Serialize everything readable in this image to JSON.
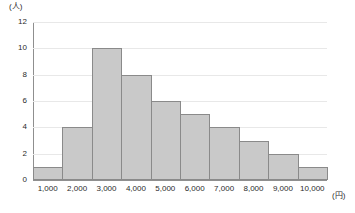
{
  "chart_data": {
    "type": "bar",
    "title": "",
    "subtitle": "",
    "xlabel": "(円)",
    "ylabel": "(人)",
    "xlim": [
      1000,
      10000
    ],
    "ylim": [
      0,
      12
    ],
    "grid": true,
    "legend": "none",
    "bin_edges": [
      1000,
      2000,
      3000,
      4000,
      5000,
      6000,
      7000,
      8000,
      9000,
      10000,
      11000
    ],
    "categories": [
      "1,000-2,000",
      "2,000-3,000",
      "3,000-4,000",
      "4,000-5,000",
      "5,000-6,000",
      "6,000-7,000",
      "7,000-8,000",
      "8,000-9,000",
      "9,000-10,000",
      "10,000-11,000"
    ],
    "values": [
      1,
      4,
      10,
      8,
      6,
      5,
      4,
      3,
      2,
      1
    ],
    "x_tick_labels": [
      "1,000",
      "2,000",
      "3,000",
      "4,000",
      "5,000",
      "6,000",
      "7,000",
      "8,000",
      "9,000",
      "10,000"
    ],
    "y_tick_labels": [
      "0",
      "2",
      "4",
      "6",
      "8",
      "10",
      "12"
    ],
    "y_tick_values": [
      0,
      2,
      4,
      6,
      8,
      10,
      12
    ],
    "colors": {
      "bar_fill": "#c9c9c9",
      "bar_border": "#8a8a8a",
      "gridline": "#e8e8e8",
      "axis": "#8f8f8f",
      "background": "#ffffff",
      "text": "#2b2b2b"
    }
  }
}
